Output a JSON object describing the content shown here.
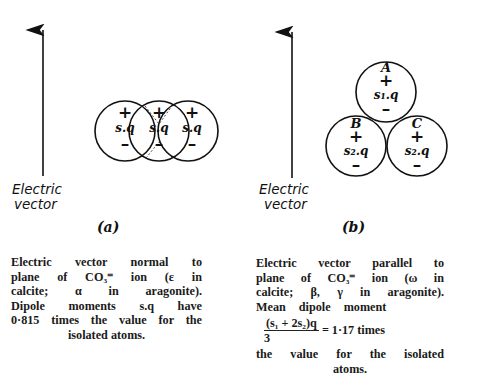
{
  "figure_a": {
    "label": "(a)",
    "arrow_label_line1": "Electric",
    "arrow_label_line2": "vector",
    "atoms": [
      {
        "plus": "+",
        "moment": "s.q",
        "minus": "–"
      },
      {
        "plus": "+",
        "moment": "s.q",
        "minus": "–"
      },
      {
        "plus": "+",
        "moment": "s.q",
        "minus": "–"
      }
    ],
    "caption_lines": [
      "Electric vector normal to",
      "plane of CO₃⁼ ion (ε in",
      "calcite; α in aragonite).",
      "Dipole moments s.q have",
      "0·815 times the value for the"
    ],
    "caption_last": "isolated atoms."
  },
  "figure_b": {
    "label": "(b)",
    "arrow_label_line1": "Electric",
    "arrow_label_line2": "vector",
    "atoms": [
      {
        "name": "A",
        "plus": "+",
        "moment": "s₁.q",
        "minus": "–"
      },
      {
        "name": "B",
        "plus": "+",
        "moment": "s₂.q",
        "minus": "–"
      },
      {
        "name": "C",
        "plus": "+",
        "moment": "s₂.q",
        "minus": "–"
      }
    ],
    "caption_lines": [
      "Electric vector parallel to",
      "plane of CO₃⁼ ion (ω in",
      "calcite; β, γ in aragonite).",
      "Mean dipole moment"
    ],
    "fraction_numerator": "(s₁ + 2s₂)q",
    "fraction_denominator": "3",
    "fraction_result": "= 1·17 times",
    "caption_after": "the value for the isolated",
    "caption_last": "atoms."
  }
}
